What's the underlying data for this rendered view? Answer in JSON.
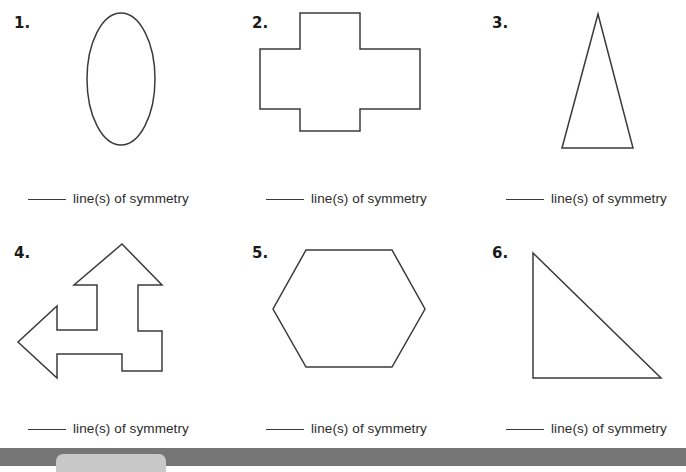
{
  "worksheet": {
    "answer_label": "line(s) of symmetry",
    "blank_placeholder": "",
    "ink_color": "#3b3b3b",
    "page_background": "#ffffff",
    "bottom_bar_color": "#767676",
    "bottom_pill_color": "#c8c8c8"
  },
  "problems": [
    {
      "number": "1.",
      "shape_name": "ellipse",
      "answer_label": "line(s) of symmetry"
    },
    {
      "number": "2.",
      "shape_name": "cross",
      "answer_label": "line(s) of symmetry"
    },
    {
      "number": "3.",
      "shape_name": "isosceles-triangle",
      "answer_label": "line(s) of symmetry"
    },
    {
      "number": "4.",
      "shape_name": "bent-double-arrow",
      "answer_label": "line(s) of symmetry"
    },
    {
      "number": "5.",
      "shape_name": "hexagon",
      "answer_label": "line(s) of symmetry"
    },
    {
      "number": "6.",
      "shape_name": "right-triangle",
      "answer_label": "line(s) of symmetry"
    }
  ]
}
